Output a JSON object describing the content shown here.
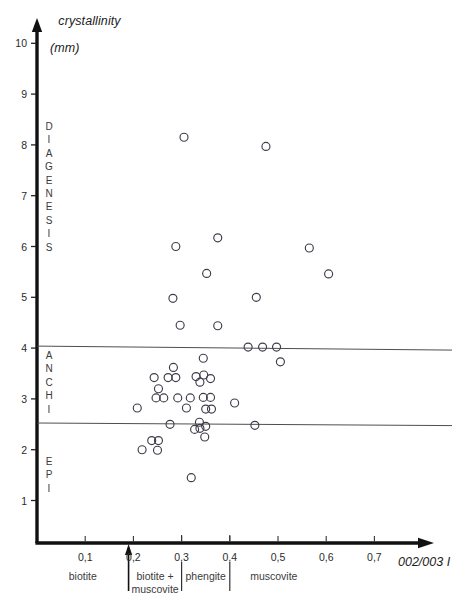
{
  "figure": {
    "y_axis_title_line1": "crystallinity",
    "y_axis_title_line2": "(mm)",
    "x_axis_title": "002/003 I"
  },
  "axes": {
    "y_ticks": [
      {
        "value": 10,
        "label": "10"
      },
      {
        "value": 9,
        "label": "9"
      },
      {
        "value": 8,
        "label": "8"
      },
      {
        "value": 7,
        "label": "7"
      },
      {
        "value": 6,
        "label": "6"
      },
      {
        "value": 5,
        "label": "5"
      },
      {
        "value": 4,
        "label": "4"
      },
      {
        "value": 3,
        "label": "3"
      },
      {
        "value": 2,
        "label": "2"
      },
      {
        "value": 1,
        "label": "1"
      }
    ],
    "x_ticks": [
      {
        "value": 0.1,
        "label": "0,1"
      },
      {
        "value": 0.2,
        "label": "0,2"
      },
      {
        "value": 0.3,
        "label": "0,3"
      },
      {
        "value": 0.4,
        "label": "0,4"
      },
      {
        "value": 0.5,
        "label": "0,5"
      },
      {
        "value": 0.6,
        "label": "0,6"
      },
      {
        "value": 0.7,
        "label": "0,7"
      }
    ]
  },
  "facies_labels": [
    {
      "name": "diagenesis",
      "text": "D\nI\nA\nG\nE\nN\nE\nS\nI\nS"
    },
    {
      "name": "anchi",
      "text": "A\nN\nC\nH\nI"
    },
    {
      "name": "epi",
      "text": "E\nP\nI"
    }
  ],
  "mineral_zones": [
    {
      "name": "biotite",
      "label": "biotite"
    },
    {
      "name": "biotite-muscovite",
      "label": "biotite +\nmuscovite"
    },
    {
      "name": "phengite",
      "label": "phengite"
    },
    {
      "name": "muscovite",
      "label": "muscovite"
    }
  ],
  "chart_data": {
    "type": "scatter",
    "title": "crystallinity (mm)",
    "xlabel": "002/003 I",
    "ylabel": "crystallinity (mm)",
    "xlim": [
      0.0,
      0.75
    ],
    "ylim": [
      0.45,
      10.4
    ],
    "grid": false,
    "legend": null,
    "marker": "open-circle",
    "series": [
      {
        "name": "samples",
        "points": [
          [
            0.305,
            8.15
          ],
          [
            0.475,
            7.97
          ],
          [
            0.375,
            6.17
          ],
          [
            0.565,
            5.97
          ],
          [
            0.288,
            6.0
          ],
          [
            0.605,
            5.46
          ],
          [
            0.352,
            5.47
          ],
          [
            0.455,
            5.0
          ],
          [
            0.282,
            4.98
          ],
          [
            0.297,
            4.45
          ],
          [
            0.375,
            4.44
          ],
          [
            0.438,
            4.02
          ],
          [
            0.468,
            4.02
          ],
          [
            0.497,
            4.02
          ],
          [
            0.505,
            3.73
          ],
          [
            0.345,
            3.8
          ],
          [
            0.283,
            3.62
          ],
          [
            0.243,
            3.42
          ],
          [
            0.272,
            3.42
          ],
          [
            0.288,
            3.42
          ],
          [
            0.33,
            3.44
          ],
          [
            0.346,
            3.47
          ],
          [
            0.338,
            3.33
          ],
          [
            0.36,
            3.4
          ],
          [
            0.252,
            3.2
          ],
          [
            0.247,
            3.02
          ],
          [
            0.263,
            3.02
          ],
          [
            0.292,
            3.02
          ],
          [
            0.318,
            3.02
          ],
          [
            0.345,
            3.03
          ],
          [
            0.36,
            3.03
          ],
          [
            0.41,
            2.92
          ],
          [
            0.208,
            2.82
          ],
          [
            0.31,
            2.82
          ],
          [
            0.35,
            2.8
          ],
          [
            0.362,
            2.8
          ],
          [
            0.276,
            2.5
          ],
          [
            0.337,
            2.54
          ],
          [
            0.338,
            2.42
          ],
          [
            0.327,
            2.4
          ],
          [
            0.35,
            2.46
          ],
          [
            0.348,
            2.25
          ],
          [
            0.452,
            2.48
          ],
          [
            0.238,
            2.18
          ],
          [
            0.252,
            2.18
          ],
          [
            0.218,
            2.0
          ],
          [
            0.25,
            1.99
          ],
          [
            0.32,
            1.45
          ]
        ]
      }
    ],
    "reference_lines": [
      {
        "name": "diagenesis-anchi-boundary",
        "y": 4.0,
        "x_from": 0.0,
        "x_to": 0.75
      },
      {
        "name": "anchi-epi-boundary",
        "y": 2.5,
        "x_from": 0.0,
        "x_to": 0.75
      }
    ],
    "zone_boundaries_x": [
      0.19,
      0.3,
      0.4
    ]
  }
}
